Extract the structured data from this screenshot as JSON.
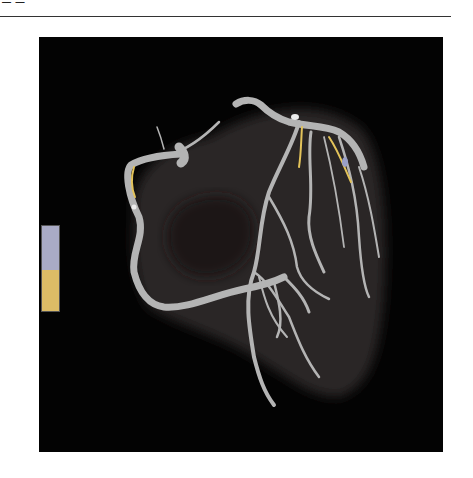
{
  "page": {
    "header_fragment": "— —"
  },
  "figure": {
    "background": "#030303",
    "vessel_color": "#b4b4b4",
    "myocardium_color": "#2a2727",
    "highlight_color": "#e3c35a",
    "legend": {
      "segments": [
        {
          "name": "lavender",
          "color": "#a9abc6"
        },
        {
          "name": "yellow",
          "color": "#dcbc66"
        }
      ]
    }
  }
}
